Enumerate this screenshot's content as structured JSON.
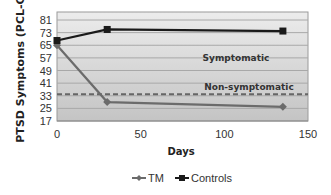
{
  "chart_data": {
    "type": "line",
    "title": "",
    "xlabel": "Days",
    "ylabel": "PTSD Symptoms (PCL-C)",
    "xlim": [
      0,
      150
    ],
    "ylim": [
      17,
      81
    ],
    "x_ticks": [
      "0",
      "50",
      "100",
      "150"
    ],
    "y_ticks": [
      "81",
      "73",
      "65",
      "57",
      "49",
      "41",
      "33",
      "25",
      "17"
    ],
    "grid": true,
    "legend_position": "bottom",
    "x": [
      0,
      30,
      135
    ],
    "series": [
      {
        "name": "TM",
        "values": [
          65,
          29,
          26
        ],
        "color": "#6b6b6b",
        "marker": "diamond"
      },
      {
        "name": "Controls",
        "values": [
          68,
          75,
          74
        ],
        "color": "#1a1a1a",
        "marker": "square"
      }
    ],
    "threshold": {
      "value": 34,
      "style": "dashed",
      "color": "#666666"
    },
    "annotations": [
      {
        "text": "Symptomatic",
        "x": 100,
        "y": 56
      },
      {
        "text": "Non-symptomatic",
        "x": 100,
        "y": 37
      }
    ]
  },
  "axis": {
    "ylabel": "PTSD Symptoms (PCL-C)",
    "xlabel": "Days"
  },
  "legend": {
    "tm": "TM",
    "controls": "Controls"
  },
  "annotations": {
    "symptomatic": "Symptomatic",
    "non_symptomatic": "Non-symptomatic"
  }
}
